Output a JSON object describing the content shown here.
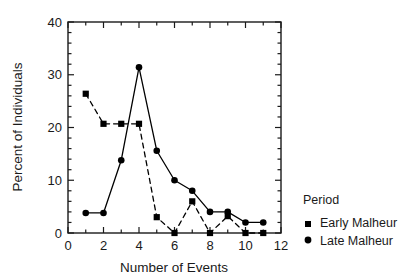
{
  "chart_data": {
    "type": "line",
    "title": "",
    "xlabel": "Number of Events",
    "ylabel": "Percent of Individuals",
    "xlim": [
      0,
      12
    ],
    "ylim": [
      0,
      40
    ],
    "xticks": [
      0,
      2,
      4,
      6,
      8,
      10,
      12
    ],
    "xtick_labels": [
      "0",
      "2",
      "4",
      "6",
      "8",
      "10",
      "12"
    ],
    "yticks": [
      0,
      10,
      20,
      30,
      40
    ],
    "ytick_labels": [
      "0",
      "10",
      "20",
      "30",
      "40"
    ],
    "x_minor_tick_step": 1,
    "y_minor_tick_step": 2,
    "grid": false,
    "legend_position": "right",
    "legend_title": "Period",
    "x": [
      1,
      2,
      3,
      4,
      5,
      6,
      7,
      8,
      9,
      10,
      11
    ],
    "series": [
      {
        "name": "Early Malheur",
        "marker": "square",
        "linestyle": "dashed",
        "color": "#000000",
        "values": [
          26.4,
          20.7,
          20.7,
          20.7,
          3.0,
          0.0,
          6.0,
          0.0,
          3.2,
          0.0,
          0.0
        ]
      },
      {
        "name": "Late Malheur",
        "marker": "circle",
        "linestyle": "solid",
        "color": "#000000",
        "values": [
          3.8,
          3.8,
          13.8,
          31.4,
          15.6,
          10.0,
          8.0,
          4.0,
          4.0,
          2.0,
          2.0
        ]
      }
    ]
  },
  "legend": {
    "title": "Period",
    "entries": [
      {
        "label": "Early Malheur",
        "marker": "square-marker"
      },
      {
        "label": "Late Malheur",
        "marker": "circle-marker"
      }
    ]
  },
  "axes": {
    "x_title": "Number of Events",
    "y_title": "Percent of Individuals"
  },
  "colors": {
    "ink": "#000000",
    "background": "#ffffff"
  }
}
